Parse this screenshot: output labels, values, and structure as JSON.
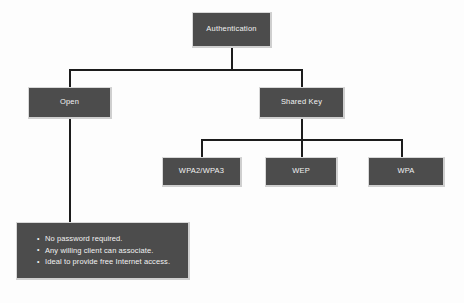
{
  "diagram": {
    "background_color": "#fdfdfd",
    "node_fill_color": "#4c4c4c",
    "node_text_color": "#f2f2f2",
    "line_color": "#1c1c1c",
    "nodes": {
      "root": {
        "label": "Authentication"
      },
      "open": {
        "label": "Open"
      },
      "shared_key": {
        "label": "Shared Key"
      },
      "wpa2_wpa3": {
        "label": "WPA2/WPA3"
      },
      "wep": {
        "label": "WEP"
      },
      "wpa": {
        "label": "WPA"
      }
    },
    "info_box": {
      "bullets": [
        "No password required.",
        "Any willing client can associate.",
        "Ideal to provide free Internet access."
      ]
    }
  }
}
